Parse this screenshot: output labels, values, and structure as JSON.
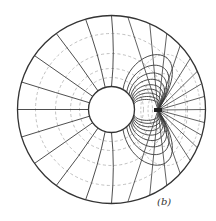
{
  "figure": {
    "label": "(b)",
    "label_pos": {
      "x": 157,
      "y": 196
    },
    "colors": {
      "background": "#ffffff",
      "solid_line": "#3a3a3a",
      "dashed_line": "#b0b0b0",
      "boundary": "#333333"
    },
    "outer_circle": {
      "cx": 111.5,
      "cy": 109.5,
      "r": 94
    },
    "inner_circle": {
      "cx": 111.5,
      "cy": 109.5,
      "r": 23
    },
    "dipole": {
      "x": 158,
      "y": 110
    },
    "dashed_circles_r": [
      32,
      41,
      56,
      76
    ],
    "left_radial_angles_deg": [
      90,
      106,
      126,
      145,
      163,
      180,
      197,
      215,
      234,
      254,
      270
    ],
    "right_fan_angles_deg": [
      -80,
      -66,
      -54,
      -43,
      -33,
      -24,
      -16,
      -8,
      0,
      8,
      16,
      24,
      33,
      43,
      54,
      66,
      80
    ],
    "loop_sizes": [
      0.08,
      0.14,
      0.21,
      0.29,
      0.38,
      0.49,
      0.62,
      0.78,
      1.0
    ],
    "dashed_loop_sizes": [
      0.25,
      0.55,
      0.95
    ]
  }
}
